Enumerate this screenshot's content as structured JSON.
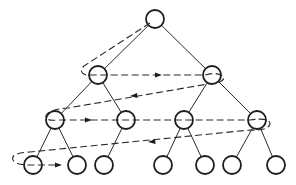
{
  "diagram": {
    "type": "tree-level-order-traversal",
    "colors": {
      "line": "#2a2a2a",
      "node_stroke": "#1e1e1e",
      "background": "#ffffff"
    },
    "node_radius": 9,
    "nodes": [
      {
        "id": "n0",
        "x": 155,
        "y": 19,
        "level": 0
      },
      {
        "id": "n1",
        "x": 98,
        "y": 75,
        "level": 1
      },
      {
        "id": "n2",
        "x": 212,
        "y": 75,
        "level": 1
      },
      {
        "id": "n3",
        "x": 55,
        "y": 120,
        "level": 2
      },
      {
        "id": "n4",
        "x": 126,
        "y": 120,
        "level": 2
      },
      {
        "id": "n5",
        "x": 184,
        "y": 120,
        "level": 2
      },
      {
        "id": "n6",
        "x": 257,
        "y": 120,
        "level": 2
      },
      {
        "id": "n7",
        "x": 33,
        "y": 165,
        "level": 3
      },
      {
        "id": "n8",
        "x": 77,
        "y": 165,
        "level": 3
      },
      {
        "id": "n9",
        "x": 104,
        "y": 165,
        "level": 3
      },
      {
        "id": "n10",
        "x": 163,
        "y": 165,
        "level": 3
      },
      {
        "id": "n11",
        "x": 205,
        "y": 165,
        "level": 3
      },
      {
        "id": "n12",
        "x": 232,
        "y": 165,
        "level": 3
      },
      {
        "id": "n13",
        "x": 276,
        "y": 165,
        "level": 3
      }
    ],
    "edges": [
      [
        "n0",
        "n1"
      ],
      [
        "n0",
        "n2"
      ],
      [
        "n1",
        "n3"
      ],
      [
        "n1",
        "n4"
      ],
      [
        "n2",
        "n5"
      ],
      [
        "n2",
        "n6"
      ],
      [
        "n3",
        "n7"
      ],
      [
        "n3",
        "n8"
      ],
      [
        "n4",
        "n9"
      ],
      [
        "n5",
        "n10"
      ],
      [
        "n5",
        "n11"
      ],
      [
        "n6",
        "n12"
      ],
      [
        "n6",
        "n13"
      ]
    ],
    "traversal": {
      "style": "dashed",
      "order": [
        "n0",
        "n1",
        "n2",
        "n3",
        "n4",
        "n5",
        "n6",
        "n7",
        "n8"
      ]
    }
  }
}
